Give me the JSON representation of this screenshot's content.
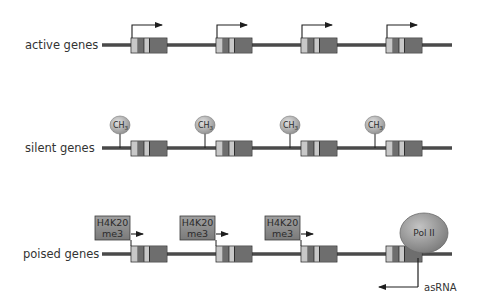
{
  "diagram": {
    "rows": [
      {
        "id": "active",
        "label": "active genes",
        "marker": "transcription-arrow",
        "gene_count": 4
      },
      {
        "id": "silent",
        "label": "silent genes",
        "marker": "methyl-group",
        "marker_text": "CH",
        "marker_subscript": "3",
        "gene_count": 4
      },
      {
        "id": "poised",
        "label": "poised genes",
        "marker": "histone-mark",
        "marker_text_line1": "H4K20",
        "marker_text_line2": "me3",
        "marker_count": 3,
        "gene_count": 4,
        "polymerase_label": "Pol II",
        "antisense_label": "asRNA"
      }
    ],
    "colors": {
      "chromatin_line": "#4a4a4a",
      "gene_light": "#c8c8c8",
      "gene_dark": "#6e6e6e",
      "gene_mid": "#7d7d7d",
      "gene_outline": "#2e2e2e",
      "arrow": "#1e1e1e",
      "ch3_fill": "#b5b5b5",
      "histone_box_fill": "#8c8c8c",
      "polymerase_fill": "#9a9a9a"
    }
  }
}
